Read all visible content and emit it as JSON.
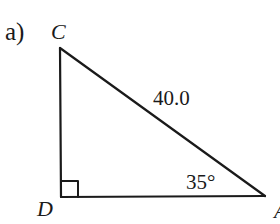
{
  "figure": {
    "part_label": "a)",
    "vertices": {
      "C": {
        "label": "C",
        "x": 60,
        "y": 48
      },
      "D": {
        "label": "D",
        "x": 61,
        "y": 197
      },
      "A": {
        "label": "A",
        "x": 265,
        "y": 196
      }
    },
    "hypotenuse_label": "40.0",
    "angle_label": "35°",
    "right_angle_at": "D",
    "stroke_color": "#1a1a1a"
  }
}
